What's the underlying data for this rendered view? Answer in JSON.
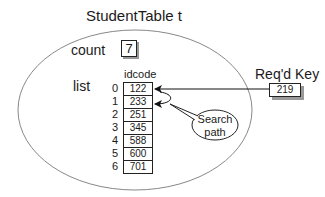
{
  "title": "StudentTable  t",
  "count": {
    "label": "count",
    "value": "7"
  },
  "list": {
    "label": "list",
    "column_header": "idcode",
    "rows": [
      {
        "index": "0",
        "value": "122"
      },
      {
        "index": "1",
        "value": "233"
      },
      {
        "index": "2",
        "value": "251"
      },
      {
        "index": "3",
        "value": "345"
      },
      {
        "index": "4",
        "value": "588"
      },
      {
        "index": "5",
        "value": "600"
      },
      {
        "index": "6",
        "value": "701"
      }
    ]
  },
  "required_key": {
    "label": "Req'd Key",
    "value": "219"
  },
  "callout": {
    "line1": "Search",
    "line2": "path"
  }
}
